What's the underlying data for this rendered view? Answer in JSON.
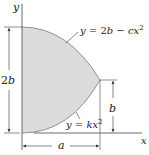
{
  "diagram": {
    "axes": {
      "x_label": "x",
      "y_label": "y"
    },
    "curves": {
      "upper": {
        "prefix": "y = 2",
        "b": "b",
        "minus": " − ",
        "c": "cx",
        "exp": "2"
      },
      "lower": {
        "prefix": "y = ",
        "k": "kx",
        "exp": "2"
      }
    },
    "dimensions": {
      "height_total": {
        "num": "2",
        "var": "b"
      },
      "height_tip": "b",
      "width": "a"
    },
    "colors": {
      "fill": "#d9d9d9",
      "line": "#333333"
    }
  }
}
